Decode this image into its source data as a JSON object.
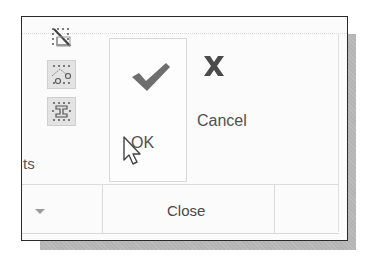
{
  "ribbon": {
    "left_group": {
      "truncated_label": "ts",
      "icons": [
        {
          "name": "trim-diagonal-icon",
          "active": false
        },
        {
          "name": "polygon-points-icon",
          "active": true
        },
        {
          "name": "i-beam-snap-icon",
          "active": true
        }
      ],
      "dropdown_icon": "chevron-down-icon"
    },
    "ok_button": {
      "label": "OK",
      "icon": "check-icon",
      "color": "#6e6e6e"
    },
    "cancel_button": {
      "label": "Cancel",
      "icon": "x-icon",
      "color": "#4a4a4a"
    },
    "panel_label": "Close"
  },
  "cursor": {
    "icon": "mouse-pointer-icon"
  }
}
